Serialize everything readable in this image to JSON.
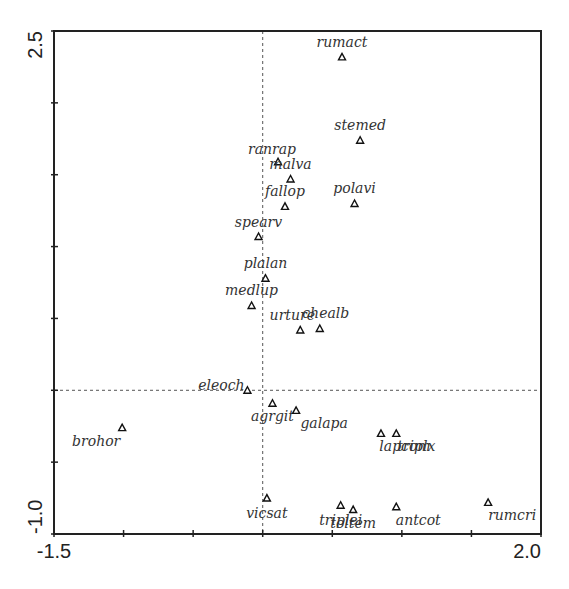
{
  "chart_data": {
    "type": "scatter",
    "title": "",
    "xlabel": "",
    "ylabel": "",
    "xlim": [
      -1.5,
      2.0
    ],
    "ylim": [
      -1.0,
      2.5
    ],
    "x_tick_labels": [
      "-1.5",
      "2.0"
    ],
    "y_tick_labels": [
      "-1.0",
      "2.5"
    ],
    "x_minor_ticks_step": 0.5,
    "y_minor_ticks_step": 0.5,
    "reference_lines": {
      "x": 0,
      "y": 0,
      "style": "dashed"
    },
    "grid": false,
    "legend": null,
    "marker": "open-triangle",
    "points": [
      {
        "label": "rumact",
        "x": 0.57,
        "y": 2.32,
        "lx": 0,
        "ly": -10
      },
      {
        "label": "stemed",
        "x": 0.7,
        "y": 1.74,
        "lx": 0,
        "ly": -10
      },
      {
        "label": "ranrap",
        "x": 0.11,
        "y": 1.59,
        "lx": -6,
        "ly": -8
      },
      {
        "label": "malva",
        "x": 0.2,
        "y": 1.47,
        "lx": 0,
        "ly": -10
      },
      {
        "label": "fallop",
        "x": 0.16,
        "y": 1.28,
        "lx": 0,
        "ly": -10
      },
      {
        "label": "polavi",
        "x": 0.66,
        "y": 1.3,
        "lx": 0,
        "ly": -10
      },
      {
        "label": "spearv",
        "x": -0.03,
        "y": 1.07,
        "lx": 0,
        "ly": -10
      },
      {
        "label": "plalan",
        "x": 0.02,
        "y": 0.78,
        "lx": 0,
        "ly": -10
      },
      {
        "label": "medlup",
        "x": -0.08,
        "y": 0.59,
        "lx": 0,
        "ly": -10
      },
      {
        "label": "urture",
        "x": 0.27,
        "y": 0.42,
        "lx": -8,
        "ly": -10
      },
      {
        "label": "chealb",
        "x": 0.41,
        "y": 0.43,
        "lx": 6,
        "ly": -10
      },
      {
        "label": "eleoch",
        "x": -0.11,
        "y": 0.0,
        "lx": -26,
        "ly": 0
      },
      {
        "label": "agrgit",
        "x": 0.07,
        "y": -0.09,
        "lx": 0,
        "ly": 18
      },
      {
        "label": "galapa",
        "x": 0.24,
        "y": -0.14,
        "lx": 28,
        "ly": 18
      },
      {
        "label": "brohor",
        "x": -1.01,
        "y": -0.26,
        "lx": -26,
        "ly": 18
      },
      {
        "label": "lapcom",
        "x": 0.85,
        "y": -0.3,
        "lx": 24,
        "ly": 18
      },
      {
        "label": "triplx",
        "x": 0.96,
        "y": -0.3,
        "lx": 20,
        "ly": 18
      },
      {
        "label": "vicsat",
        "x": 0.03,
        "y": -0.75,
        "lx": 0,
        "ly": 20
      },
      {
        "label": "triplei",
        "x": 0.56,
        "y": -0.8,
        "lx": 0,
        "ly": 20
      },
      {
        "label": "toltem",
        "x": 0.65,
        "y": -0.83,
        "lx": 0,
        "ly": 18
      },
      {
        "label": "antcot",
        "x": 0.96,
        "y": -0.81,
        "lx": 22,
        "ly": 18
      },
      {
        "label": "rumcri",
        "x": 1.62,
        "y": -0.78,
        "lx": 24,
        "ly": 18
      }
    ]
  },
  "axes": {
    "x_min_label": "-1.5",
    "x_max_label": "2.0",
    "y_min_label": "-1.0",
    "y_max_label": "2.5"
  }
}
